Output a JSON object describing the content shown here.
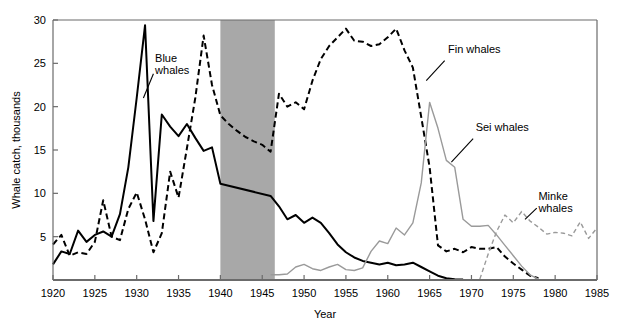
{
  "chart_data": {
    "type": "line",
    "title": "",
    "xlabel": "Year",
    "ylabel": "Whale catch, thousands",
    "xlim": [
      1920,
      1985
    ],
    "ylim": [
      0,
      30
    ],
    "xticks": [
      1920,
      1925,
      1930,
      1935,
      1940,
      1945,
      1950,
      1955,
      1960,
      1965,
      1970,
      1975,
      1980,
      1985
    ],
    "yticks": [
      5,
      10,
      15,
      20,
      25,
      30
    ],
    "grid": false,
    "legend_position": "inline-annotations",
    "shaded_region": {
      "name": "world-war-two-gap",
      "x_start": 1940,
      "x_end": 1946.5,
      "color": "#a8a8a8"
    },
    "series": [
      {
        "name": "Blue whales",
        "style": "solid",
        "color": "#000000",
        "width": 2.0,
        "label_x": 1932.2,
        "label_y": 25.2,
        "points": [
          [
            1920,
            1.8
          ],
          [
            1921,
            3.3
          ],
          [
            1922,
            3.0
          ],
          [
            1923,
            5.7
          ],
          [
            1924,
            4.4
          ],
          [
            1925,
            5.2
          ],
          [
            1926,
            5.6
          ],
          [
            1927,
            5.0
          ],
          [
            1928,
            7.6
          ],
          [
            1929,
            13.0
          ],
          [
            1930,
            21.0
          ],
          [
            1931,
            29.4
          ],
          [
            1932,
            6.8
          ],
          [
            1933,
            19.1
          ],
          [
            1934,
            17.7
          ],
          [
            1935,
            16.6
          ],
          [
            1936,
            18.0
          ],
          [
            1937,
            16.4
          ],
          [
            1938,
            14.9
          ],
          [
            1939,
            15.3
          ],
          [
            1940,
            11.1
          ],
          [
            1946,
            9.7
          ],
          [
            1947,
            8.5
          ],
          [
            1948,
            7.0
          ],
          [
            1949,
            7.5
          ],
          [
            1950,
            6.6
          ],
          [
            1951,
            7.2
          ],
          [
            1952,
            6.6
          ],
          [
            1953,
            5.4
          ],
          [
            1954,
            4.1
          ],
          [
            1955,
            3.2
          ],
          [
            1956,
            2.6
          ],
          [
            1957,
            2.2
          ],
          [
            1958,
            2.0
          ],
          [
            1959,
            1.8
          ],
          [
            1960,
            2.0
          ],
          [
            1961,
            1.7
          ],
          [
            1962,
            1.8
          ],
          [
            1963,
            2.0
          ],
          [
            1964,
            1.5
          ],
          [
            1965,
            1.0
          ],
          [
            1966,
            0.5
          ],
          [
            1967,
            0.2
          ],
          [
            1968,
            0.1
          ],
          [
            1969,
            0.05
          ]
        ]
      },
      {
        "name": "Fin whales",
        "style": "dashed",
        "color": "#000000",
        "width": 2.0,
        "label_x": 1967.2,
        "label_y": 26.2,
        "points": [
          [
            1920,
            4.1
          ],
          [
            1921,
            5.2
          ],
          [
            1922,
            2.8
          ],
          [
            1923,
            3.2
          ],
          [
            1924,
            3.0
          ],
          [
            1925,
            4.4
          ],
          [
            1926,
            9.2
          ],
          [
            1927,
            5.0
          ],
          [
            1928,
            4.6
          ],
          [
            1929,
            8.2
          ],
          [
            1930,
            10.1
          ],
          [
            1931,
            7.0
          ],
          [
            1932,
            3.2
          ],
          [
            1933,
            5.4
          ],
          [
            1934,
            12.5
          ],
          [
            1935,
            9.5
          ],
          [
            1936,
            15.2
          ],
          [
            1937,
            21.0
          ],
          [
            1938,
            28.2
          ],
          [
            1939,
            22.5
          ],
          [
            1940,
            19.0
          ],
          [
            1941,
            18.0
          ],
          [
            1942,
            17.2
          ],
          [
            1943,
            16.5
          ],
          [
            1944,
            16.0
          ],
          [
            1945,
            15.6
          ],
          [
            1946,
            14.8
          ],
          [
            1947,
            21.5
          ],
          [
            1948,
            20.0
          ],
          [
            1949,
            20.5
          ],
          [
            1950,
            19.7
          ],
          [
            1951,
            23.0
          ],
          [
            1952,
            25.5
          ],
          [
            1953,
            27.0
          ],
          [
            1954,
            28.0
          ],
          [
            1955,
            29.0
          ],
          [
            1956,
            27.6
          ],
          [
            1957,
            27.5
          ],
          [
            1958,
            27.0
          ],
          [
            1959,
            27.2
          ],
          [
            1960,
            28.0
          ],
          [
            1961,
            29.0
          ],
          [
            1962,
            26.5
          ],
          [
            1963,
            24.5
          ],
          [
            1964,
            18.8
          ],
          [
            1965,
            13.0
          ],
          [
            1966,
            4.0
          ],
          [
            1967,
            3.3
          ],
          [
            1968,
            3.6
          ],
          [
            1969,
            3.2
          ],
          [
            1970,
            3.8
          ],
          [
            1971,
            3.6
          ],
          [
            1972,
            3.6
          ],
          [
            1973,
            3.8
          ],
          [
            1974,
            2.7
          ],
          [
            1975,
            1.9
          ],
          [
            1976,
            1.2
          ],
          [
            1977,
            0.5
          ],
          [
            1978,
            0.2
          ]
        ]
      },
      {
        "name": "Sei whales",
        "style": "solid",
        "color": "#9a9a9a",
        "width": 1.4,
        "label_x": 1970.5,
        "label_y": 17.2,
        "points": [
          [
            1946,
            0.6
          ],
          [
            1947,
            0.6
          ],
          [
            1948,
            0.7
          ],
          [
            1949,
            1.5
          ],
          [
            1950,
            1.8
          ],
          [
            1951,
            1.3
          ],
          [
            1952,
            1.1
          ],
          [
            1953,
            1.5
          ],
          [
            1954,
            1.8
          ],
          [
            1955,
            1.2
          ],
          [
            1956,
            1.1
          ],
          [
            1957,
            1.4
          ],
          [
            1958,
            3.3
          ],
          [
            1959,
            4.5
          ],
          [
            1960,
            4.2
          ],
          [
            1961,
            6.0
          ],
          [
            1962,
            5.2
          ],
          [
            1963,
            6.6
          ],
          [
            1964,
            11.2
          ],
          [
            1965,
            20.5
          ],
          [
            1966,
            17.5
          ],
          [
            1967,
            13.8
          ],
          [
            1968,
            13.0
          ],
          [
            1969,
            7.0
          ],
          [
            1970,
            6.2
          ],
          [
            1971,
            6.2
          ],
          [
            1972,
            6.3
          ],
          [
            1973,
            5.2
          ],
          [
            1974,
            4.0
          ],
          [
            1975,
            2.8
          ],
          [
            1976,
            1.6
          ],
          [
            1977,
            0.6
          ],
          [
            1978,
            0.1
          ]
        ]
      },
      {
        "name": "Minke whales",
        "style": "dashed",
        "color": "#9a9a9a",
        "width": 1.4,
        "label_x": 1978.0,
        "label_y": 9.2,
        "points": [
          [
            1971,
            0.1
          ],
          [
            1972,
            3.0
          ],
          [
            1973,
            5.6
          ],
          [
            1974,
            7.5
          ],
          [
            1975,
            6.6
          ],
          [
            1976,
            7.9
          ],
          [
            1977,
            6.8
          ],
          [
            1978,
            6.1
          ],
          [
            1979,
            5.3
          ],
          [
            1980,
            5.5
          ],
          [
            1981,
            5.4
          ],
          [
            1982,
            5.1
          ],
          [
            1983,
            6.7
          ],
          [
            1984,
            4.8
          ],
          [
            1985,
            6.0
          ]
        ]
      }
    ],
    "annotations": [
      {
        "name": "blue-whales-leader",
        "from": [
          1932.0,
          23.8
        ],
        "to": [
          1930.8,
          21.0
        ]
      },
      {
        "name": "fin-whales-leader",
        "from": [
          1966.8,
          25.3
        ],
        "to": [
          1964.6,
          23.0
        ]
      },
      {
        "name": "sei-whales-leader",
        "from": [
          1970.2,
          16.3
        ],
        "to": [
          1967.6,
          13.6
        ]
      },
      {
        "name": "minke-whales-leader",
        "from": [
          1977.8,
          8.3
        ],
        "to": [
          1976.4,
          7.0
        ]
      }
    ]
  },
  "axis": {
    "ylabel": "Whale catch, thousands",
    "xlabel": "Year",
    "xticks": [
      "1920",
      "1925",
      "1930",
      "1935",
      "1940",
      "1945",
      "1950",
      "1955",
      "1960",
      "1965",
      "1970",
      "1975",
      "1980",
      "1985"
    ],
    "yticks": [
      "5",
      "10",
      "15",
      "20",
      "25",
      "30"
    ]
  },
  "labels": {
    "blue": "Blue\nwhales",
    "blue_line1": "Blue",
    "blue_line2": "whales",
    "fin": "Fin whales",
    "sei": "Sei whales",
    "minke_line1": "Minke",
    "minke_line2": "whales"
  },
  "colors": {
    "axis": "#6b6b6b",
    "black_series": "#000000",
    "gray_series": "#9a9a9a",
    "shaded_band": "#a8a8a8",
    "background": "#ffffff"
  }
}
